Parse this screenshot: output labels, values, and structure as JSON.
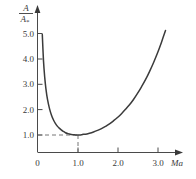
{
  "chart_data": {
    "type": "line",
    "title": "",
    "xlabel": "Ma",
    "ylabel_numerator": "A",
    "ylabel_denominator": "A",
    "ylabel_denominator_star": "*",
    "xlim": [
      0,
      3.35
    ],
    "ylim": [
      0,
      5.4
    ],
    "grid": false,
    "legend": null,
    "x_ticks": [
      "0",
      "1.0",
      "2.0",
      "3.0"
    ],
    "x_tick_values": [
      0,
      1.0,
      2.0,
      3.0
    ],
    "y_ticks": [
      "1.0",
      "2.0",
      "3.0",
      "4.0",
      "5.0"
    ],
    "y_tick_values": [
      1.0,
      2.0,
      3.0,
      4.0,
      5.0
    ],
    "series": [
      {
        "name": "A/A*",
        "x": [
          0.12,
          0.15,
          0.18,
          0.21,
          0.25,
          0.3,
          0.35,
          0.4,
          0.45,
          0.5,
          0.55,
          0.6,
          0.65,
          0.7,
          0.75,
          0.8,
          0.85,
          0.9,
          0.95,
          1.0,
          1.05,
          1.1,
          1.15,
          1.2,
          1.3,
          1.4,
          1.5,
          1.6,
          1.7,
          1.8,
          1.9,
          2.0,
          2.1,
          2.2,
          2.3,
          2.4,
          2.5,
          2.6,
          2.7,
          2.8,
          2.9,
          3.0,
          3.1,
          3.2
        ],
        "y": [
          4.96,
          3.92,
          3.28,
          2.83,
          2.4,
          2.04,
          1.78,
          1.59,
          1.45,
          1.34,
          1.26,
          1.19,
          1.14,
          1.09,
          1.06,
          1.04,
          1.02,
          1.01,
          1.0,
          1.0,
          1.0,
          1.01,
          1.03,
          1.03,
          1.07,
          1.12,
          1.18,
          1.25,
          1.34,
          1.44,
          1.56,
          1.69,
          1.84,
          2.01,
          2.19,
          2.4,
          2.64,
          2.9,
          3.18,
          3.5,
          3.85,
          4.23,
          4.66,
          5.12
        ]
      }
    ],
    "annotations": [
      {
        "name": "minimum-guide",
        "x": 1.0,
        "y": 1.0,
        "style": "dashed",
        "description": "Dashed lines marking the minimum area ratio of 1.0 at Mach 1.0"
      }
    ]
  }
}
